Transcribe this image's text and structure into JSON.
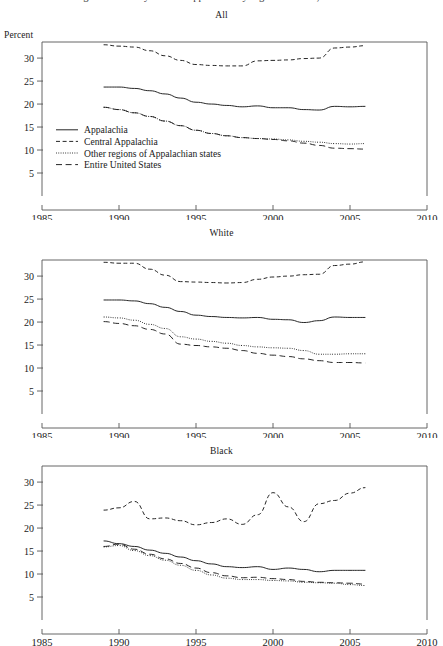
{
  "document": {
    "clipped_header_text": "Figure 1. Poverty rates in Appalachia by region and race, 1989-2006"
  },
  "axis": {
    "y_label": "Percent",
    "y_ticks": [
      5,
      10,
      15,
      20,
      25,
      30
    ],
    "y_min": 0,
    "y_max": 33.5,
    "x_ticks": [
      1985,
      1990,
      1995,
      2000,
      2005,
      2010
    ],
    "x_min": 1985,
    "x_max": 2010
  },
  "legend": {
    "panel": "All",
    "items": [
      {
        "label": "Appalachia",
        "style": "solid"
      },
      {
        "label": "Central Appalachia",
        "style": "dashed"
      },
      {
        "label": "Other regions of Appalachian states",
        "style": "dotted"
      },
      {
        "label": "Entire United States",
        "style": "longdash"
      }
    ]
  },
  "chart_data": [
    {
      "type": "line",
      "title": "All",
      "xlabel": "",
      "ylabel": "Percent",
      "xlim": [
        1985,
        2010
      ],
      "ylim": [
        0,
        33.5
      ],
      "grid": false,
      "legend_position": "inside-lower-left",
      "x": [
        1989,
        1990,
        1991,
        1992,
        1993,
        1994,
        1995,
        1996,
        1997,
        1998,
        1999,
        2000,
        2001,
        2002,
        2003,
        2004,
        2005,
        2006
      ],
      "series": [
        {
          "name": "Appalachia",
          "style": "solid",
          "values": [
            23.7,
            23.7,
            23.4,
            22.9,
            22.2,
            21.3,
            20.4,
            20.0,
            19.7,
            19.4,
            19.6,
            19.2,
            19.2,
            18.8,
            18.7,
            19.5,
            19.4,
            19.5
          ]
        },
        {
          "name": "Central Appalachia",
          "style": "dashed",
          "values": [
            32.9,
            32.6,
            32.4,
            31.6,
            30.5,
            29.5,
            28.6,
            28.4,
            28.3,
            28.3,
            29.4,
            29.5,
            29.6,
            29.9,
            30.0,
            32.2,
            32.4,
            32.7
          ]
        },
        {
          "name": "Other regions of Appalachian states",
          "style": "dotted",
          "values": [
            19.3,
            18.8,
            18.1,
            17.3,
            16.3,
            15.3,
            14.3,
            13.6,
            13.1,
            12.7,
            12.5,
            12.4,
            12.2,
            11.9,
            11.7,
            11.4,
            11.3,
            11.4
          ]
        },
        {
          "name": "Entire United States",
          "style": "longdash",
          "values": [
            19.3,
            18.8,
            18.1,
            17.3,
            16.3,
            15.3,
            14.3,
            13.6,
            13.1,
            12.7,
            12.5,
            12.3,
            12.0,
            11.5,
            11.0,
            10.4,
            10.3,
            10.2
          ]
        }
      ]
    },
    {
      "type": "line",
      "title": "White",
      "xlabel": "",
      "ylabel": "Percent",
      "xlim": [
        1985,
        2010
      ],
      "ylim": [
        0,
        33.5
      ],
      "grid": false,
      "legend_position": "none",
      "x": [
        1989,
        1990,
        1991,
        1992,
        1993,
        1994,
        1995,
        1996,
        1997,
        1998,
        1999,
        2000,
        2001,
        2002,
        2003,
        2004,
        2005,
        2006
      ],
      "series": [
        {
          "name": "Appalachia",
          "style": "solid",
          "values": [
            24.8,
            24.8,
            24.6,
            24.0,
            23.2,
            22.3,
            21.5,
            21.2,
            21.0,
            20.9,
            21.0,
            20.6,
            20.5,
            19.9,
            20.3,
            21.1,
            21.0,
            21.0
          ]
        },
        {
          "name": "Central Appalachia",
          "style": "dashed",
          "values": [
            33.0,
            32.8,
            32.8,
            31.5,
            30.2,
            28.8,
            28.7,
            28.6,
            28.5,
            28.6,
            29.3,
            29.8,
            30.0,
            30.3,
            30.4,
            32.3,
            32.6,
            33.1
          ]
        },
        {
          "name": "Other regions of Appalachian states",
          "style": "dotted",
          "values": [
            21.1,
            20.9,
            20.4,
            19.5,
            18.6,
            16.8,
            16.3,
            15.8,
            15.4,
            14.9,
            14.6,
            14.4,
            14.3,
            13.8,
            13.0,
            13.0,
            13.1,
            13.1
          ]
        },
        {
          "name": "Entire United States",
          "style": "longdash",
          "values": [
            20.1,
            19.7,
            19.2,
            18.4,
            17.4,
            15.2,
            14.9,
            14.6,
            14.3,
            13.8,
            13.2,
            12.8,
            12.5,
            12.0,
            11.6,
            11.2,
            11.2,
            11.1
          ]
        }
      ]
    },
    {
      "type": "line",
      "title": "Black",
      "xlabel": "",
      "ylabel": "Percent",
      "xlim": [
        1985,
        2010
      ],
      "ylim": [
        0,
        33.5
      ],
      "grid": false,
      "legend_position": "none",
      "x": [
        1989,
        1990,
        1991,
        1992,
        1993,
        1994,
        1995,
        1996,
        1997,
        1998,
        1999,
        2000,
        2001,
        2002,
        2003,
        2004,
        2005,
        2006
      ],
      "series": [
        {
          "name": "Appalachia",
          "style": "solid",
          "values": [
            17.2,
            16.6,
            16.0,
            15.2,
            14.5,
            13.7,
            12.9,
            12.2,
            11.6,
            11.4,
            11.6,
            11.0,
            11.3,
            11.0,
            10.5,
            10.8,
            10.8,
            10.8
          ]
        },
        {
          "name": "Central Appalachia",
          "style": "dashed",
          "values": [
            23.9,
            24.4,
            25.8,
            22.0,
            22.2,
            21.6,
            20.7,
            21.2,
            22.0,
            20.8,
            22.9,
            27.7,
            24.6,
            21.4,
            25.3,
            26.0,
            27.6,
            28.8
          ]
        },
        {
          "name": "Other regions of Appalachian states",
          "style": "dotted",
          "values": [
            15.9,
            16.2,
            15.1,
            14.0,
            13.0,
            11.9,
            10.8,
            9.8,
            9.1,
            8.8,
            8.8,
            8.6,
            8.5,
            8.2,
            8.1,
            8.0,
            7.7,
            7.5
          ]
        },
        {
          "name": "Entire United States",
          "style": "longdash",
          "values": [
            16.0,
            16.5,
            15.4,
            14.3,
            13.3,
            12.3,
            11.3,
            10.3,
            9.6,
            9.2,
            9.3,
            9.0,
            8.8,
            8.4,
            8.2,
            8.1,
            8.0,
            7.8
          ]
        }
      ]
    }
  ]
}
